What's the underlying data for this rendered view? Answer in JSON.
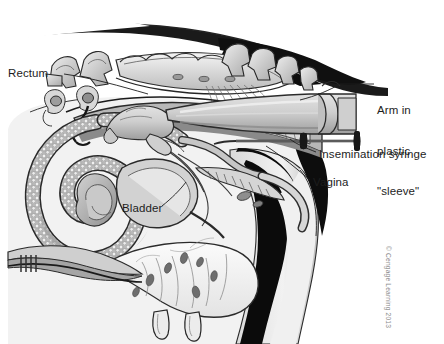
{
  "figure": {
    "type": "anatomical-illustration",
    "style": "grayscale line drawing",
    "width": 444,
    "height": 344,
    "background_color": "#ffffff"
  },
  "labels": {
    "rectum": "Rectum",
    "arm_line1": "Arm in",
    "arm_line2": "plastic",
    "arm_line3": "\"sleeve\"",
    "insemination_syringe": "Insemination syringe",
    "vagina": "Vagina",
    "bladder": "Bladder"
  },
  "credit": {
    "text": "© Cengage Learning 2013"
  },
  "colors": {
    "ink": "#1d1d1d",
    "credit_gray": "#8b8b8b",
    "tissue_light": "#e9e9e9",
    "tissue_mid": "#c4c4c4",
    "tissue_dark": "#9a9a9a",
    "shadow_black": "#111111",
    "outline": "#2a2a2a"
  },
  "structures": [
    "sacrum and tail vertebrae",
    "rectum",
    "ovary",
    "oviduct",
    "uterine horns with cotyledons",
    "cervix",
    "vagina",
    "bladder",
    "udder and teats",
    "hind limb",
    "operator arm in plastic sleeve",
    "insemination syringe"
  ]
}
